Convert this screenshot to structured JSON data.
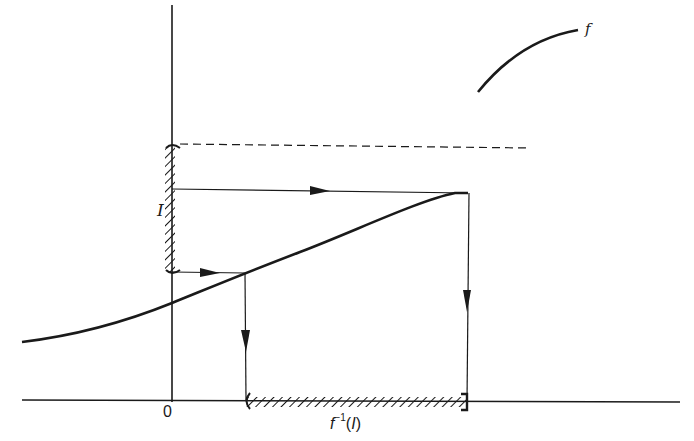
{
  "diagram": {
    "labels": {
      "origin": "0",
      "interval": "I",
      "function": "f",
      "preimage_f": "f",
      "preimage_sup": "−1",
      "preimage_open": "(",
      "preimage_I": "I",
      "preimage_close": ")"
    },
    "colors": {
      "ink": "#1a1a1a",
      "background": "#ffffff"
    },
    "elements": {
      "y_axis": "vertical axis",
      "x_axis": "horizontal axis",
      "asymptote": "dashed horizontal line (supremum of f)",
      "curve": "graph of f (increasing, bounded above)",
      "interval_on_y": "hatched interval I on y-axis",
      "interval_on_x": "hatched preimage f^-1(I) on x-axis",
      "arrows": [
        "upper horizontal arrow to curve",
        "lower horizontal arrow to curve",
        "left vertical arrow down",
        "right vertical arrow down"
      ],
      "legend_curve": "sample curve labeled f"
    }
  }
}
